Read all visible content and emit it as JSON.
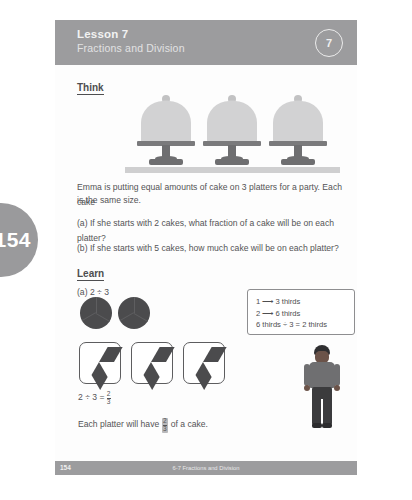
{
  "page": {
    "number": "154",
    "footer_page": "154",
    "footer_center": "6-7 Fractions and Division"
  },
  "header": {
    "lesson": "Lesson 7",
    "subtitle": "Fractions and Division",
    "badge": "7"
  },
  "think": {
    "heading": "Think",
    "intro_line1": "Emma is putting equal amounts of cake on 3 platters for a party. Each cake",
    "intro_line2": "is the same size.",
    "part_a": "(a)  If she starts with 2 cakes, what fraction of a cake will be on each platter?",
    "part_b": "(b)  If she starts with 5 cakes, how much cake will be on each platter?"
  },
  "learn": {
    "heading": "Learn",
    "part_a_label": "(a)  2 ÷ 3",
    "equation_lhs": "2 ÷ 3 =",
    "equation_num": "2",
    "equation_den": "3",
    "sentence_before": "Each platter will have",
    "sentence_num": "2",
    "sentence_den": "3",
    "sentence_after": "of a cake."
  },
  "callout": {
    "line1": "1 ⟶ 3 thirds",
    "line2": "2 ⟶ 6 thirds",
    "line3": "6 thirds ÷ 3 = 2 thirds"
  },
  "colors": {
    "band": "#9c9c9e",
    "tab": "#9a9a9c",
    "ink": "#4b4b4d"
  }
}
